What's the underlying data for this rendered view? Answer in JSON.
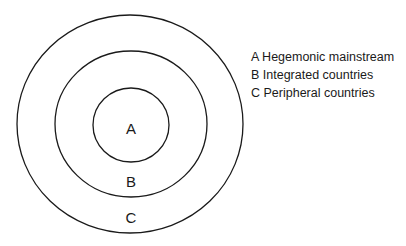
{
  "diagram": {
    "type": "concentric-circles",
    "rings": [
      {
        "letter": "A",
        "name": "Hegemonic mainstream"
      },
      {
        "letter": "B",
        "name": "Integrated countries"
      },
      {
        "letter": "C",
        "name": "Peripheral countries"
      }
    ],
    "stroke_color": "#1a1a1a"
  },
  "labels": {
    "a": "A",
    "b": "B",
    "c": "C"
  },
  "legend": {
    "items": [
      "A Hegemonic mainstream",
      "B Integrated countries",
      "C Peripheral countries"
    ]
  }
}
